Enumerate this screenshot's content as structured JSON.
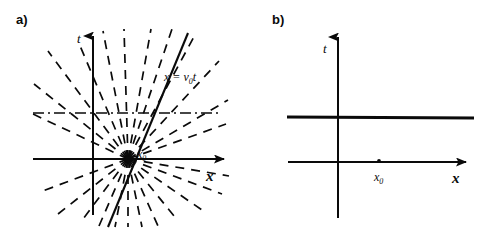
{
  "figure": {
    "width": 504,
    "height": 232,
    "background": "#ffffff",
    "ink_color": "#0a0a0a"
  },
  "panels": [
    {
      "id": "panel-a",
      "label": "a)",
      "label_pos": {
        "x": 16,
        "y": 24
      },
      "origin": {
        "x": 128,
        "y": 159
      },
      "axes": {
        "x_axis": {
          "label": "x",
          "label_pos": {
            "x": 206,
            "y": 181
          },
          "y": 159,
          "x_start": 33,
          "x_end": 228,
          "arrow": "right"
        },
        "t_axis": {
          "label": "t",
          "label_pos": {
            "x": 77,
            "y": 43
          },
          "x": 93,
          "y_start": 215,
          "y_end": 29,
          "arrow": "up"
        }
      },
      "solid_world_line": {
        "label": "x = v₀t",
        "label_parts": {
          "lhs": "x = v",
          "sub": "0",
          "rhs": "t"
        },
        "label_pos": {
          "x": 164,
          "y": 81
        },
        "slope_note": "steep positive slope through origin"
      },
      "dash_dot_line": {
        "y": 113,
        "x_start": 33,
        "x_end": 222,
        "style": "dash-dot"
      },
      "origin_marker": {
        "label": "x₀",
        "label_base": "x",
        "label_sub": "0",
        "label_pos": {
          "x": 137,
          "y": 158
        }
      },
      "fan_description": "bundle of dashed straight world lines radiating from the point x0 on the x-axis, spanning upward and downward in a symmetric star",
      "fan_angles_deg": [
        -72,
        -60,
        -47,
        -33,
        -19,
        -7,
        7,
        19,
        33,
        47,
        60,
        72,
        100,
        112,
        124,
        138,
        152,
        166,
        194,
        208,
        222,
        236,
        248,
        260
      ]
    },
    {
      "id": "panel-b",
      "label": "b)",
      "label_pos": {
        "x": 272,
        "y": 24
      },
      "origin": {
        "x": 338,
        "y": 162
      },
      "axes": {
        "x_axis": {
          "label": "x",
          "label_pos": {
            "x": 452,
            "y": 183
          },
          "y": 162,
          "x_start": 288,
          "x_end": 470,
          "arrow": "right"
        },
        "t_axis": {
          "label": "t",
          "label_pos": {
            "x": 323,
            "y": 53
          },
          "x": 338,
          "y_start": 218,
          "y_end": 30,
          "arrow": "up"
        }
      },
      "horizontal_line": {
        "y": 117,
        "x_start": 287,
        "x_end": 474,
        "style": "thick-solid",
        "description": "single thick horizontal line of simultaneity"
      },
      "point_marker": {
        "label": "x₀",
        "label_base": "x",
        "label_sub": "0",
        "dot_pos": {
          "x": 379,
          "y": 161
        },
        "label_pos": {
          "x": 374,
          "y": 181
        }
      }
    }
  ]
}
